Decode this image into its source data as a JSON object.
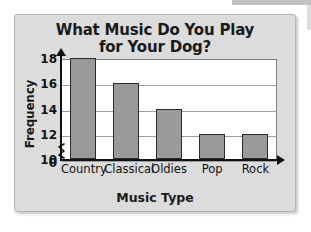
{
  "chart_data": {
    "type": "bar",
    "title": "What Music Do You Play for Your Dog?",
    "title_line1": "What Music Do You Play",
    "title_line2": "for Your Dog?",
    "xlabel": "Music Type",
    "ylabel": "Frequency",
    "categories": [
      "Country",
      "Classical",
      "Oldies",
      "Pop",
      "Rock"
    ],
    "values": [
      18,
      16,
      14,
      12,
      12
    ],
    "ytick_labels": [
      "0",
      "10",
      "12",
      "14",
      "16",
      "18"
    ],
    "ytick_values": [
      0,
      10,
      12,
      14,
      16,
      18
    ],
    "ylim": [
      10,
      18
    ],
    "axis_break": true,
    "axis_break_between": [
      0,
      10
    ],
    "grid": "horizontal",
    "legend": "none",
    "bar_color": "#9a9a9a",
    "bar_border_color": "#2b2b2b",
    "plot_background": "#ffffff",
    "panel_background": "#dcdcdc",
    "text_color": "#111111"
  }
}
